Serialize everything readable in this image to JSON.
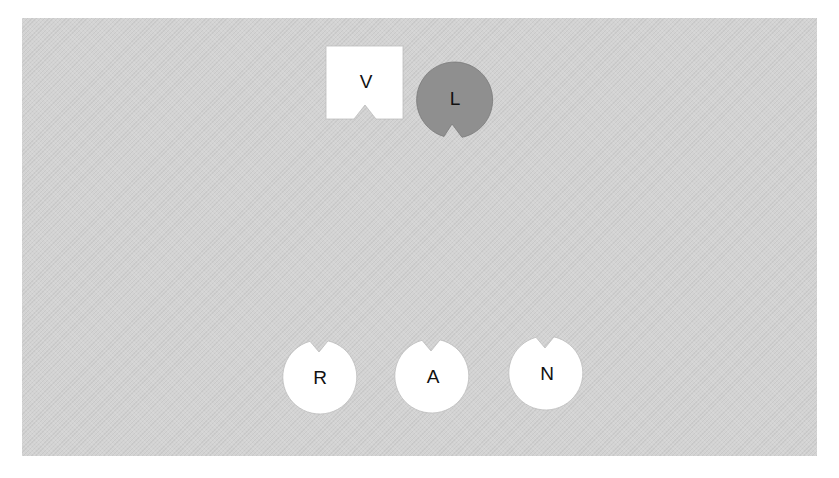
{
  "canvas": {
    "background": "#ffffff",
    "panel_color": "#d3d3d3"
  },
  "shapes": [
    {
      "id": "V",
      "label": "V",
      "kind": "notched-square",
      "fill": "#ffffff",
      "notch": "bottom"
    },
    {
      "id": "L",
      "label": "L",
      "kind": "notched-circle",
      "fill": "#8f8f8f",
      "notch": "bottom"
    },
    {
      "id": "R",
      "label": "R",
      "kind": "notched-circle",
      "fill": "#ffffff",
      "notch": "top"
    },
    {
      "id": "A",
      "label": "A",
      "kind": "notched-circle",
      "fill": "#ffffff",
      "notch": "top"
    },
    {
      "id": "N",
      "label": "N",
      "kind": "notched-circle",
      "fill": "#ffffff",
      "notch": "top"
    }
  ]
}
